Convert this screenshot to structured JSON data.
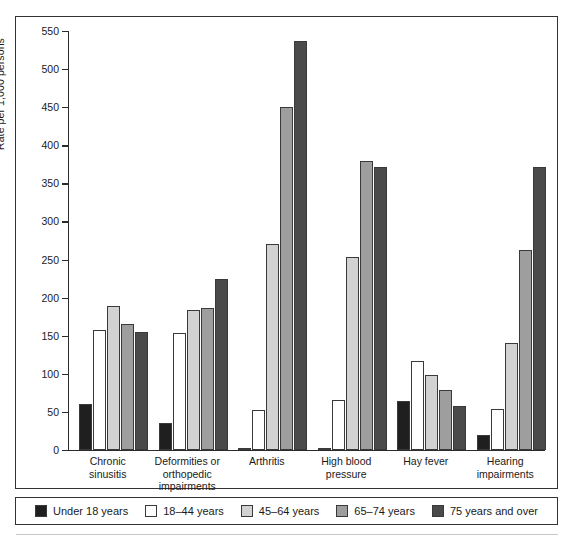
{
  "chart_data": {
    "type": "bar",
    "title": "",
    "xlabel": "",
    "ylabel": "Rate per 1,000 persons",
    "ylim": [
      0,
      550
    ],
    "yticks": [
      0,
      50,
      100,
      150,
      200,
      250,
      300,
      350,
      400,
      450,
      500,
      550
    ],
    "grid": false,
    "legend_position": "bottom",
    "categories": [
      "Chronic sinusitis",
      "Deformities or orthopedic impairments",
      "Arthritis",
      "High blood pressure",
      "Hay fever",
      "Hearing impairments"
    ],
    "category_lines": [
      [
        "Chronic",
        "sinusitis"
      ],
      [
        "Deformities or",
        "orthopedic",
        "impairments"
      ],
      [
        "Arthritis"
      ],
      [
        "High blood",
        "pressure"
      ],
      [
        "Hay fever"
      ],
      [
        "Hearing",
        "impairments"
      ]
    ],
    "series": [
      {
        "name": "Under 18 years",
        "color": "#1f1f1f",
        "values": [
          61,
          36,
          2,
          3,
          64,
          20
        ]
      },
      {
        "name": "18–44 years",
        "color": "#ffffff",
        "values": [
          157,
          154,
          52,
          65,
          117,
          54
        ]
      },
      {
        "name": "45–64 years",
        "color": "#d2d2d2",
        "values": [
          189,
          184,
          270,
          254,
          99,
          141
        ]
      },
      {
        "name": "65–74 years",
        "color": "#9e9e9e",
        "values": [
          166,
          186,
          450,
          379,
          79,
          263
        ]
      },
      {
        "name": "75 years and over",
        "color": "#4a4a4a",
        "values": [
          155,
          224,
          537,
          372,
          58,
          371
        ]
      }
    ]
  },
  "legend": {
    "items": [
      {
        "label": "Under 18 years",
        "color": "#1f1f1f"
      },
      {
        "label": "18–44 years",
        "color": "#ffffff"
      },
      {
        "label": "45–64 years",
        "color": "#d2d2d2"
      },
      {
        "label": "65–74 years",
        "color": "#9e9e9e"
      },
      {
        "label": "75 years and over",
        "color": "#4a4a4a"
      }
    ]
  }
}
